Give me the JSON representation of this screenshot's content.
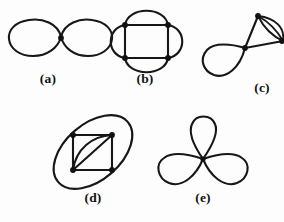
{
  "plate": {
    "width": 284,
    "height": 222,
    "background_color": "#fdfdfd",
    "ink_color": "#171717",
    "vertex_color": "#111111"
  },
  "figures": [
    {
      "id": "a",
      "label": "(a)",
      "caption_x": 48,
      "caption_y": 71,
      "description": "figure-eight: two loops meeting at one central vertex",
      "vertices": 1,
      "edges": 2,
      "loops": 2
    },
    {
      "id": "b",
      "label": "(b)",
      "caption_x": 145,
      "caption_y": 71,
      "description": "square on four vertices with an extra outward arc parallel to each side",
      "vertices": 4,
      "edges": 8,
      "loops": 0
    },
    {
      "id": "c",
      "label": "(c)",
      "caption_x": 262,
      "caption_y": 80,
      "description": "triangle-like graph: one loop at the central vertex and three parallel arcs between the top and right vertices",
      "vertices": 3,
      "edges": 6,
      "loops": 1
    },
    {
      "id": "d",
      "label": "(d)",
      "caption_x": 93,
      "caption_y": 190,
      "description": "square with a doubled diagonal (straight chord plus bowed arc) inscribed in a large tilted ellipse",
      "vertices": 4,
      "edges": 7,
      "loops": 0
    },
    {
      "id": "e",
      "label": "(e)",
      "caption_x": 203,
      "caption_y": 190,
      "description": "three petal loops meeting at a single central vertex",
      "vertices": 1,
      "edges": 3,
      "loops": 3
    }
  ]
}
